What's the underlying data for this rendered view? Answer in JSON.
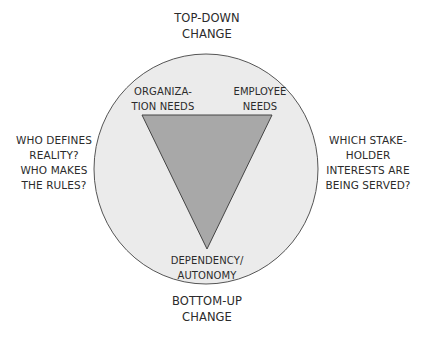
{
  "diagram": {
    "top_label": {
      "lines": [
        "TOP-DOWN",
        "CHANGE"
      ]
    },
    "bottom_label": {
      "lines": [
        "BOTTOM-UP",
        "CHANGE"
      ]
    },
    "left_label": {
      "lines": [
        "WHO DEFINES",
        "REALITY?",
        "WHO MAKES",
        "THE RULES?"
      ]
    },
    "right_label": {
      "lines": [
        "WHICH  STAKE-",
        "HOLDER",
        "INTERESTS ARE",
        "BEING SERVED?"
      ]
    },
    "triangle_corners": {
      "top_left": {
        "lines": [
          "ORGANIZA-",
          "TION NEEDS"
        ]
      },
      "top_right": {
        "lines": [
          "EMPLOYEE",
          "NEEDS"
        ]
      },
      "bottom": {
        "lines": [
          "DEPENDENCY/",
          "AUTONOMY"
        ]
      }
    },
    "colors": {
      "background": "#ffffff",
      "circle_fill": "#ebebeb",
      "circle_stroke": "#555555",
      "triangle_fill": "#a8a8a8",
      "triangle_stroke": "#444444",
      "text": "#2b2b2b"
    }
  }
}
